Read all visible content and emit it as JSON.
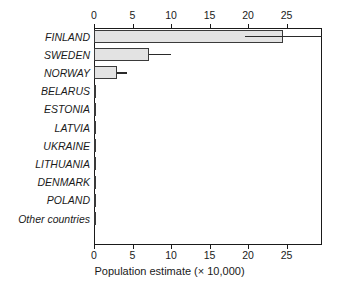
{
  "chart_data": {
    "type": "bar",
    "orientation": "horizontal",
    "title": "",
    "xlabel": "Population estimate (× 10,000)",
    "ylabel": "",
    "xlim": [
      0,
      29.6
    ],
    "xticks": [
      0,
      5,
      10,
      15,
      20,
      25
    ],
    "xtick_labels": [
      "0",
      "5",
      "10",
      "15",
      "20",
      "25"
    ],
    "grid": false,
    "legend": "none",
    "axis_top_labels": true,
    "axis_bottom_labels": true,
    "bar_fill_color": "#e3e3e3",
    "bar_edge_color": "#3a3a3a",
    "error_bar_color": "#2a2a2a",
    "categories": [
      "FINLAND",
      "SWEDEN",
      "NORWAY",
      "BELARUS",
      "ESTONIA",
      "LATVIA",
      "UKRAINE",
      "LITHUANIA",
      "DENMARK",
      "POLAND",
      "Other countries"
    ],
    "values": [
      24.5,
      7.1,
      3.0,
      0.3,
      0.15,
      0.05,
      0.05,
      0.05,
      0.05,
      0.05,
      0.05
    ],
    "error_low": [
      19.6,
      7.1,
      3.0,
      null,
      null,
      null,
      null,
      null,
      null,
      null,
      null
    ],
    "error_high": [
      29.6,
      10.0,
      4.3,
      null,
      null,
      null,
      null,
      null,
      null,
      null,
      null
    ],
    "series_name": "Population estimate"
  }
}
